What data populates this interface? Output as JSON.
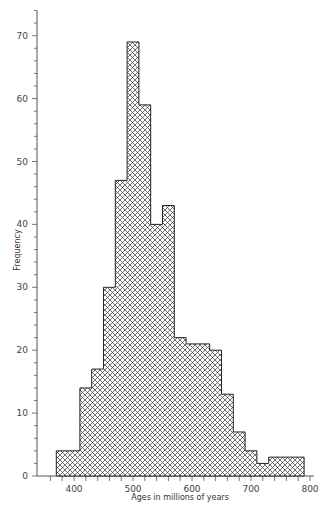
{
  "chart_data": {
    "type": "bar",
    "subtype": "histogram",
    "title": "",
    "xlabel": "Ages in millions of years",
    "ylabel": "Frequency",
    "bin_edges": [
      370,
      390,
      410,
      430,
      450,
      470,
      490,
      510,
      530,
      550,
      570,
      590,
      610,
      630,
      650,
      670,
      690,
      710,
      730,
      750,
      770,
      790
    ],
    "values": [
      4,
      4,
      14,
      17,
      30,
      47,
      69,
      59,
      40,
      43,
      22,
      21,
      21,
      20,
      13,
      7,
      4,
      2,
      3,
      3,
      3
    ],
    "xlim": [
      350,
      800
    ],
    "ylim": [
      0,
      74
    ],
    "x_ticks": [
      400,
      500,
      600,
      700,
      800
    ],
    "x_minor_tick_step": 20,
    "y_ticks": [
      0,
      10,
      20,
      30,
      40,
      50,
      60,
      70
    ],
    "y_minor_tick_step": 2,
    "grid": false,
    "legend": null,
    "fill_pattern": "cross-hatch",
    "colors": {
      "edge": "#222222",
      "hatch": "#333333",
      "background": "#ffffff"
    }
  },
  "labels": {
    "xlabel": "Ages in millions of years",
    "ylabel": "Frequency"
  }
}
